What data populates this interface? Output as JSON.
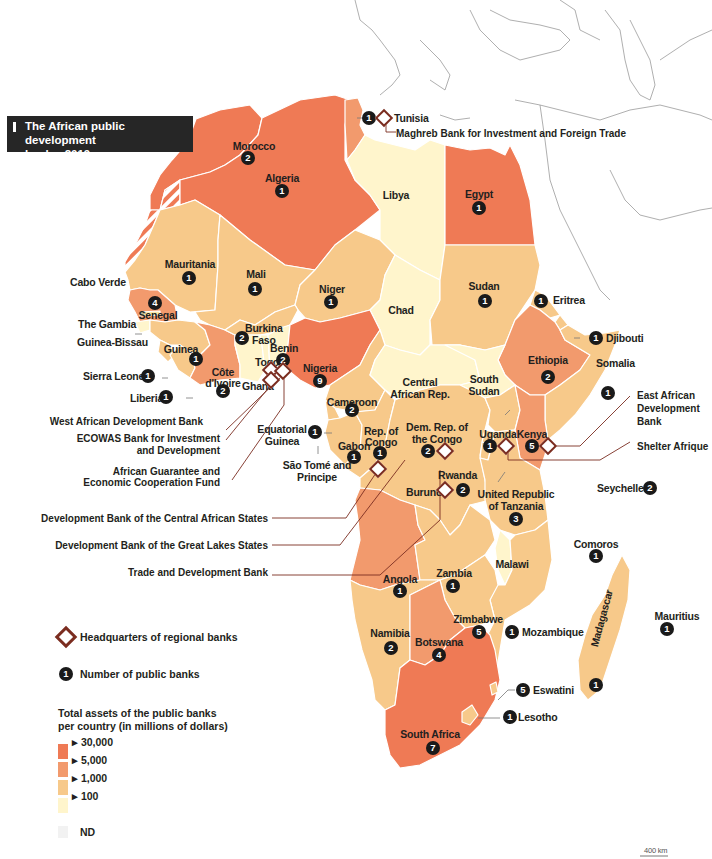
{
  "title": {
    "line1": "The African public development",
    "line2": "banks, 2019"
  },
  "colors": {
    "over_30000": "#ef7a55",
    "5000_30000": "#f29a6d",
    "1000_5000": "#f7c98a",
    "100_1000": "#fbe9a9",
    "under_100": "#fff5cc",
    "nd": "#f2f2f2",
    "badge": "#1a1a1a",
    "hq": "#7b2d20",
    "leader": "#7b2d20",
    "title_bg": "#262626"
  },
  "countries": [
    {
      "name": "Morocco",
      "banks": "2",
      "class": "30,000+"
    },
    {
      "name": "Algeria",
      "banks": "1",
      "class": "30,000+"
    },
    {
      "name": "Tunisia",
      "banks": "1",
      "class": "5,000-30,000",
      "hq": true
    },
    {
      "name": "Libya",
      "banks": "",
      "class": "ND/<100"
    },
    {
      "name": "Egypt",
      "banks": "1",
      "class": "30,000+"
    },
    {
      "name": "Mauritania",
      "banks": "1",
      "class": "100-1,000"
    },
    {
      "name": "Mali",
      "banks": "1",
      "class": "100-1,000"
    },
    {
      "name": "Niger",
      "banks": "1",
      "class": "100-1,000"
    },
    {
      "name": "Chad",
      "banks": "",
      "class": "<100"
    },
    {
      "name": "Sudan",
      "banks": "1",
      "class": "100-1,000"
    },
    {
      "name": "Eritrea",
      "banks": "1",
      "class": "100-1,000"
    },
    {
      "name": "Djibouti",
      "banks": "1",
      "class": "100-1,000"
    },
    {
      "name": "Cabo Verde",
      "banks": "",
      "class": "ND"
    },
    {
      "name": "Senegal",
      "banks": "4",
      "class": "1,000-5,000"
    },
    {
      "name": "The Gambia",
      "banks": "",
      "class": "ND"
    },
    {
      "name": "Guinea-Bissau",
      "banks": "",
      "class": "ND"
    },
    {
      "name": "Guinea",
      "banks": "1",
      "class": "100-1,000"
    },
    {
      "name": "Sierra Leone",
      "banks": "1",
      "class": "100-1,000"
    },
    {
      "name": "Liberia",
      "banks": "1",
      "class": "100-1,000"
    },
    {
      "name": "Burkina Faso",
      "banks": "2",
      "class": "100-1,000"
    },
    {
      "name": "Côte d'Ivoire",
      "banks": "2",
      "class": "1,000-5,000",
      "hq": true
    },
    {
      "name": "Ghana",
      "banks": "",
      "class": "<100"
    },
    {
      "name": "Togo",
      "banks": "",
      "class": "<100",
      "hq": true
    },
    {
      "name": "Benin",
      "banks": "2",
      "class": "<100",
      "hq": true
    },
    {
      "name": "Nigeria",
      "banks": "9",
      "class": "30,000+"
    },
    {
      "name": "Cameroon",
      "banks": "2",
      "class": "100-1,000"
    },
    {
      "name": "Central African Rep.",
      "banks": "",
      "class": "<100"
    },
    {
      "name": "South Sudan",
      "banks": "",
      "class": "<100"
    },
    {
      "name": "Ethiopia",
      "banks": "2",
      "class": "5,000-30,000"
    },
    {
      "name": "Somalia",
      "banks": "1",
      "class": "100-1,000"
    },
    {
      "name": "Equatorial Guinea",
      "banks": "1",
      "class": "100-1,000"
    },
    {
      "name": "São Tomé and Principe",
      "banks": "",
      "class": "ND"
    },
    {
      "name": "Gabon",
      "banks": "1",
      "class": "100-1,000"
    },
    {
      "name": "Rep. of Congo",
      "banks": "1",
      "class": "100-1,000",
      "hq": true
    },
    {
      "name": "Dem. Rep. of the Congo",
      "banks": "2",
      "class": "100-1,000",
      "hq": true
    },
    {
      "name": "Uganda",
      "banks": "1",
      "class": "100-1,000",
      "hq": true
    },
    {
      "name": "Kenya",
      "banks": "5",
      "class": "5,000-30,000",
      "hq": true
    },
    {
      "name": "Rwanda",
      "banks": "2",
      "class": "100-1,000"
    },
    {
      "name": "Burundi",
      "banks": "",
      "class": "100-1,000",
      "hq": true
    },
    {
      "name": "United Republic of Tanzania",
      "banks": "3",
      "class": "100-1,000"
    },
    {
      "name": "Seychelles",
      "banks": "2",
      "class": "ND"
    },
    {
      "name": "Comoros",
      "banks": "1",
      "class": "ND"
    },
    {
      "name": "Angola",
      "banks": "1",
      "class": "5,000-30,000"
    },
    {
      "name": "Zambia",
      "banks": "1",
      "class": "100-1,000"
    },
    {
      "name": "Malawi",
      "banks": "",
      "class": "<100"
    },
    {
      "name": "Madagascar",
      "banks": "1",
      "class": "100-1,000"
    },
    {
      "name": "Mauritius",
      "banks": "1",
      "class": "ND"
    },
    {
      "name": "Namibia",
      "banks": "2",
      "class": "100-1,000"
    },
    {
      "name": "Botswana",
      "banks": "4",
      "class": "5,000-30,000"
    },
    {
      "name": "Zimbabwe",
      "banks": "5",
      "class": "100-1,000"
    },
    {
      "name": "Mozambique",
      "banks": "1",
      "class": "100-1,000"
    },
    {
      "name": "Eswatini",
      "banks": "5",
      "class": "100-1,000"
    },
    {
      "name": "Lesotho",
      "banks": "1",
      "class": "100-1,000"
    },
    {
      "name": "South Africa",
      "banks": "7",
      "class": "30,000+"
    }
  ],
  "labels": {
    "morocco": "Morocco",
    "algeria": "Algeria",
    "tunisia": "Tunisia",
    "libya": "Libya",
    "egypt": "Egypt",
    "mauritania": "Mauritania",
    "mali": "Mali",
    "niger": "Niger",
    "chad": "Chad",
    "sudan": "Sudan",
    "eritrea": "Eritrea",
    "djibouti": "Djibouti",
    "cabo_verde": "Cabo Verde",
    "senegal": "Senegal",
    "gambia": "The Gambia",
    "guinea_bissau": "Guinea-Bissau",
    "guinea": "Guinea",
    "sierra_leone": "Sierra Leone",
    "liberia": "Liberia",
    "burkina_1": "Burkina",
    "burkina_2": "Faso",
    "cote_1": "Côte",
    "cote_2": "d'Ivoire",
    "ghana": "Ghana",
    "togo": "Togo",
    "benin": "Benin",
    "nigeria": "Nigeria",
    "cameroon": "Cameroon",
    "car_1": "Central",
    "car_2": "African Rep.",
    "ssudan_1": "South",
    "ssudan_2": "Sudan",
    "ethiopia": "Ethiopia",
    "somalia": "Somalia",
    "eqguinea_1": "Equatorial",
    "eqguinea_2": "Guinea",
    "stp_1": "São Tomé and",
    "stp_2": "Principe",
    "gabon": "Gabon",
    "congo_1": "Rep. of",
    "congo_2": "Congo",
    "drc_1": "Dem. Rep. of",
    "drc_2": "the Congo",
    "uganda": "Uganda",
    "kenya": "Kenya",
    "rwanda": "Rwanda",
    "burundi": "Burundi",
    "tanzania_1": "United Republic",
    "tanzania_2": "of Tanzania",
    "seychelles": "Seychelles",
    "comoros": "Comoros",
    "angola": "Angola",
    "zambia": "Zambia",
    "malawi": "Malawi",
    "madagascar": "Madagascar",
    "mauritius": "Mauritius",
    "namibia": "Namibia",
    "botswana": "Botswana",
    "zimbabwe": "Zimbabwe",
    "mozambique": "Mozambique",
    "eswatini": "Eswatini",
    "lesotho": "Lesotho",
    "south_africa": "South Africa"
  },
  "badges": {
    "morocco": "2",
    "algeria": "1",
    "tunisia": "1",
    "egypt": "1",
    "mauritania": "1",
    "mali": "1",
    "niger": "1",
    "sudan": "1",
    "eritrea": "1",
    "djibouti": "1",
    "senegal": "4",
    "guinea": "1",
    "sierra_leone": "1",
    "liberia": "1",
    "burkina": "2",
    "cote": "2",
    "benin": "2",
    "nigeria": "9",
    "cameroon": "2",
    "ethiopia": "2",
    "somalia": "1",
    "eqguinea": "1",
    "gabon": "1",
    "congo": "1",
    "drc": "2",
    "uganda": "1",
    "kenya": "5",
    "rwanda": "2",
    "tanzania": "3",
    "seychelles": "2",
    "comoros": "1",
    "angola": "1",
    "zambia": "1",
    "madagascar": "1",
    "mauritius": "1",
    "namibia": "2",
    "botswana": "4",
    "zimbabwe": "5",
    "mozambique": "1",
    "eswatini": "5",
    "lesotho": "1",
    "south_africa": "7"
  },
  "regional_banks": {
    "maghreb": "Maghreb Bank for Investment and Foreign Trade",
    "wadb": "West African Development Bank",
    "ecowas_1": "ECOWAS Bank for Investment",
    "ecowas_2": "and Development",
    "agecf_1": "African Guarantee and",
    "agecf_2": "Economic Cooperation Fund",
    "bdeac": "Development Bank of the Central African States",
    "bdegl": "Development Bank of the Great Lakes States",
    "tdb": "Trade and Development Bank",
    "eadb_1": "East African",
    "eadb_2": "Development",
    "eadb_3": "Bank",
    "shelter": "Shelter Afrique"
  },
  "legend": {
    "hq_label": "Headquarters of regional banks",
    "count_label": "Number of public banks",
    "count_sample": "1",
    "assets_title_1": "Total assets of the public banks",
    "assets_title_2": "per country (in millions of dollars)",
    "ticks": [
      "30,000",
      "5,000",
      "1,000",
      "100"
    ],
    "nd_label": "ND"
  },
  "scale": {
    "label": "400 km"
  }
}
